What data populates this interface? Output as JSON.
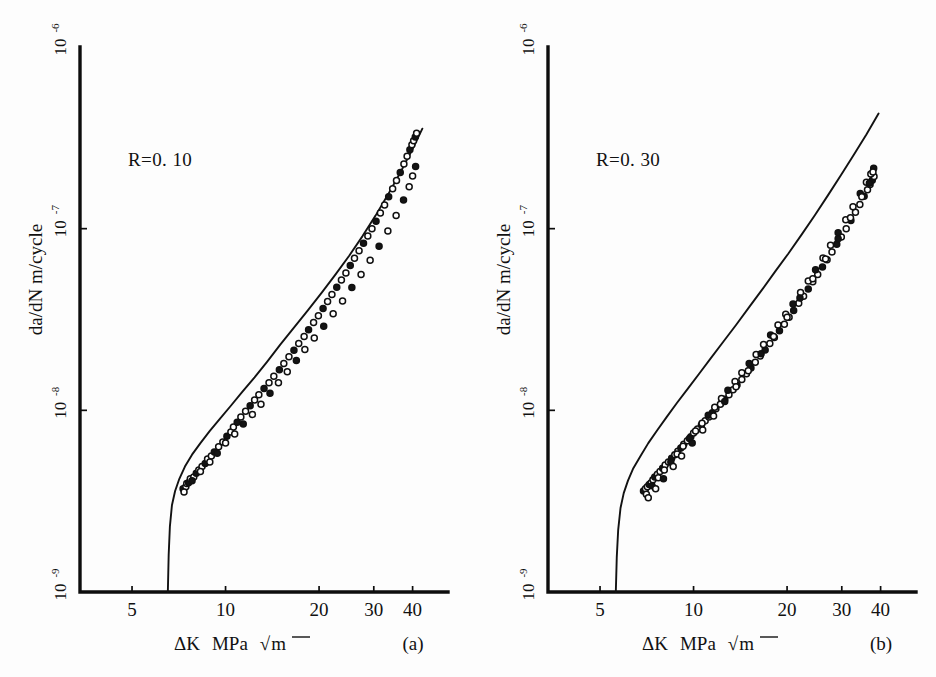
{
  "figure": {
    "panel_count": 2,
    "background": "#fdfdfd",
    "ink_color": "#111111"
  },
  "chart_data": [
    {
      "type": "scatter",
      "panel": "(a)",
      "title": "",
      "annotation": "R=0. 10",
      "annotation_parts": {
        "symbol": "R",
        "equals": "=",
        "value": "0. 10"
      },
      "xlabel": "ΔK  MPa  √m",
      "xlabel_parts": {
        "symbol": "ΔK",
        "unit": "MPa",
        "radical": "√",
        "radicand": "m"
      },
      "ylabel": "da/dN  m/cycle",
      "ylabel_parts": {
        "rate": "da/dN",
        "unit": "m/cycle"
      },
      "xscale": "log",
      "yscale": "log",
      "xlim": [
        3.4,
        52.0
      ],
      "ylim": [
        1e-09,
        1e-06
      ],
      "xticks": [
        5,
        10,
        20,
        30,
        40
      ],
      "xtick_labels": [
        "5",
        "10",
        "20",
        "30",
        "40"
      ],
      "yticks": [
        1e-09,
        1e-08,
        1e-07,
        1e-06
      ],
      "ytick_labels": [
        "10⁻⁹",
        "10⁻⁸",
        "10⁻⁷",
        "10⁻⁶"
      ],
      "ytick_mantissa": [
        "10",
        "10",
        "10",
        "10"
      ],
      "ytick_exponent": [
        "-9",
        "-8",
        "-7",
        "-6"
      ],
      "grid": false,
      "legend": "none",
      "threshold_dk": 6.5,
      "series": [
        {
          "name": "fit-curve",
          "kind": "line",
          "comment": "sigmoidal Paris-law fit with threshold asymptote",
          "x": [
            6.52,
            6.56,
            6.62,
            6.72,
            6.88,
            7.1,
            7.4,
            7.8,
            8.3,
            8.9,
            9.6,
            10.4,
            11.3,
            12.4,
            13.6,
            15.0,
            16.6,
            18.4,
            20.4,
            22.6,
            25.0,
            27.6,
            30.4,
            33.4,
            36.6,
            40.0,
            43.0
          ],
          "y": [
            1e-09,
            1.6e-09,
            2.3e-09,
            3e-09,
            3.6e-09,
            4.2e-09,
            4.9e-09,
            5.7e-09,
            6.6e-09,
            7.7e-09,
            9e-09,
            1.06e-08,
            1.26e-08,
            1.52e-08,
            1.85e-08,
            2.3e-08,
            2.85e-08,
            3.55e-08,
            4.45e-08,
            5.6e-08,
            7.1e-08,
            9.1e-08,
            1.18e-07,
            1.55e-07,
            2.05e-07,
            2.75e-07,
            3.55e-07
          ]
        },
        {
          "name": "measured-growth-rate",
          "kind": "points",
          "marker": "circle",
          "x": [
            7.3,
            7.45,
            7.5,
            7.6,
            7.7,
            7.9,
            8.05,
            8.2,
            8.4,
            8.6,
            8.75,
            9.0,
            9.2,
            9.5,
            9.8,
            10.1,
            10.4,
            10.6,
            10.9,
            11.2,
            11.6,
            12.0,
            12.4,
            12.8,
            13.3,
            13.8,
            14.3,
            14.9,
            15.4,
            16.0,
            16.6,
            17.2,
            17.9,
            18.5,
            19.2,
            19.9,
            20.6,
            21.3,
            22.0,
            22.8,
            23.6,
            24.4,
            25.2,
            26.0,
            26.9,
            27.8,
            28.7,
            29.6,
            30.5,
            31.5,
            32.5,
            33.5,
            34.5,
            35.5,
            36.5,
            37.5,
            38.4,
            39.2,
            39.8,
            40.3,
            40.8,
            41.2,
            7.35,
            7.8,
            8.3,
            8.9,
            9.4,
            10.0,
            10.7,
            11.4,
            12.2,
            13.0,
            13.9,
            14.8,
            15.8,
            16.9,
            18.0,
            19.3,
            20.7,
            22.2,
            23.8,
            25.5,
            27.3,
            29.2,
            31.2,
            33.3,
            35.4,
            37.4,
            39.0,
            40.0,
            40.9
          ],
          "y": [
            3.7e-09,
            3.8e-09,
            3.95e-09,
            4e-09,
            4.2e-09,
            4.3e-09,
            4.5e-09,
            4.7e-09,
            4.9e-09,
            5.1e-09,
            5.4e-09,
            5.6e-09,
            5.9e-09,
            6.3e-09,
            6.7e-09,
            7.2e-09,
            7.6e-09,
            8.1e-09,
            8.6e-09,
            9.2e-09,
            9.9e-09,
            1.06e-08,
            1.14e-08,
            1.22e-08,
            1.32e-08,
            1.42e-08,
            1.54e-08,
            1.67e-08,
            1.81e-08,
            1.97e-08,
            2.14e-08,
            2.33e-08,
            2.55e-08,
            2.78e-08,
            3.04e-08,
            3.32e-08,
            3.63e-08,
            3.97e-08,
            4.34e-08,
            4.76e-08,
            5.21e-08,
            5.71e-08,
            6.26e-08,
            6.87e-08,
            7.55e-08,
            8.3e-08,
            9.12e-08,
            1e-07,
            1.1e-07,
            1.22e-07,
            1.35e-07,
            1.5e-07,
            1.66e-07,
            1.84e-07,
            2.04e-07,
            2.27e-07,
            2.5e-07,
            2.72e-07,
            2.9e-07,
            3.05e-07,
            3.2e-07,
            3.35e-07,
            3.55e-09,
            4.1e-09,
            4.6e-09,
            5.2e-09,
            5.8e-09,
            6.6e-09,
            7.4e-09,
            8.4e-09,
            9.5e-09,
            1.08e-08,
            1.24e-08,
            1.42e-08,
            1.63e-08,
            1.88e-08,
            2.16e-08,
            2.5e-08,
            2.9e-08,
            3.4e-08,
            4e-08,
            4.75e-08,
            5.6e-08,
            6.7e-08,
            8e-08,
            9.7e-08,
            1.18e-07,
            1.44e-07,
            1.7e-07,
            1.95e-07,
            2.2e-07
          ]
        }
      ]
    },
    {
      "type": "scatter",
      "panel": "(b)",
      "title": "",
      "annotation": "R=0. 30",
      "annotation_parts": {
        "symbol": "R",
        "equals": "=",
        "value": "0. 30"
      },
      "xlabel": "ΔK  MPa  √m",
      "xlabel_parts": {
        "symbol": "ΔK",
        "unit": "MPa",
        "radical": "√",
        "radicand": "m"
      },
      "ylabel": "da/dN  m/cycle",
      "ylabel_parts": {
        "rate": "da/dN",
        "unit": "m/cycle"
      },
      "xscale": "log",
      "yscale": "log",
      "xlim": [
        3.4,
        52.0
      ],
      "ylim": [
        1e-09,
        1e-06
      ],
      "xticks": [
        5,
        10,
        20,
        30,
        40
      ],
      "xtick_labels": [
        "5",
        "10",
        "20",
        "30",
        "40"
      ],
      "yticks": [
        1e-09,
        1e-08,
        1e-07,
        1e-06
      ],
      "ytick_labels": [
        "10⁻⁹",
        "10⁻⁸",
        "10⁻⁷",
        "10⁻⁶"
      ],
      "ytick_mantissa": [
        "10",
        "10",
        "10",
        "10"
      ],
      "ytick_exponent": [
        "-9",
        "-8",
        "-7",
        "-6"
      ],
      "grid": false,
      "legend": "none",
      "threshold_dk": 5.6,
      "series": [
        {
          "name": "fit-curve",
          "kind": "line",
          "comment": "sigmoidal Paris-law fit with threshold asymptote",
          "x": [
            5.62,
            5.66,
            5.72,
            5.82,
            5.96,
            6.15,
            6.4,
            6.75,
            7.15,
            7.65,
            8.2,
            8.85,
            9.6,
            10.45,
            11.4,
            12.5,
            13.7,
            15.1,
            16.6,
            18.3,
            20.2,
            22.3,
            24.6,
            27.1,
            29.8,
            32.8,
            36.0,
            39.4
          ],
          "y": [
            1e-09,
            1.55e-09,
            2.2e-09,
            2.9e-09,
            3.5e-09,
            4.1e-09,
            4.8e-09,
            5.6e-09,
            6.6e-09,
            7.8e-09,
            9.2e-09,
            1.1e-08,
            1.32e-08,
            1.6e-08,
            1.95e-08,
            2.4e-08,
            2.95e-08,
            3.7e-08,
            4.6e-08,
            5.8e-08,
            7.3e-08,
            9.3e-08,
            1.19e-07,
            1.53e-07,
            1.97e-07,
            2.55e-07,
            3.3e-07,
            4.3e-07
          ]
        },
        {
          "name": "measured-growth-rate",
          "kind": "points",
          "marker": "circle",
          "x": [
            6.9,
            7.0,
            7.1,
            7.2,
            7.3,
            7.4,
            7.5,
            7.65,
            7.8,
            7.95,
            8.1,
            8.3,
            8.5,
            8.7,
            8.9,
            9.1,
            9.3,
            9.55,
            9.8,
            10.0,
            10.3,
            10.6,
            10.9,
            11.2,
            11.5,
            11.8,
            12.2,
            12.6,
            13.0,
            13.4,
            13.8,
            14.3,
            14.8,
            15.3,
            15.8,
            16.4,
            17.0,
            17.6,
            18.2,
            18.9,
            19.6,
            20.3,
            21.0,
            21.8,
            22.6,
            23.4,
            24.2,
            25.1,
            26.0,
            26.9,
            27.9,
            28.9,
            29.9,
            31.0,
            32.1,
            33.2,
            34.3,
            35.4,
            36.3,
            37.0,
            37.6,
            38.1,
            7.05,
            7.35,
            7.7,
            8.05,
            8.45,
            8.85,
            9.25,
            9.7,
            10.15,
            10.65,
            11.15,
            11.7,
            12.3,
            12.9,
            13.6,
            14.3,
            15.1,
            15.9,
            16.8,
            17.7,
            18.7,
            19.8,
            20.9,
            22.1,
            23.4,
            24.7,
            26.1,
            27.6,
            29.2,
            30.9,
            32.6,
            34.4,
            36.0,
            37.2,
            38.0,
            7.15,
            7.55,
            8.0,
            8.6,
            9.15,
            9.9,
            10.7,
            11.6,
            12.6,
            13.7,
            15.0,
            16.5,
            18.1,
            20.0,
            22.0,
            24.2,
            26.6,
            29.2,
            32.0,
            34.8,
            36.8,
            37.8
          ],
          "y": [
            3.6e-09,
            3.7e-09,
            3.8e-09,
            3.9e-09,
            4e-09,
            4.15e-09,
            4.3e-09,
            4.45e-09,
            4.6e-09,
            4.8e-09,
            5e-09,
            5.2e-09,
            5.45e-09,
            5.7e-09,
            5.95e-09,
            6.2e-09,
            6.5e-09,
            6.8e-09,
            7.15e-09,
            7.5e-09,
            7.9e-09,
            8.3e-09,
            8.75e-09,
            9.2e-09,
            9.7e-09,
            1.02e-08,
            1.08e-08,
            1.15e-08,
            1.22e-08,
            1.3e-08,
            1.38e-08,
            1.48e-08,
            1.59e-08,
            1.71e-08,
            1.84e-08,
            1.99e-08,
            2.15e-08,
            2.33e-08,
            2.52e-08,
            2.74e-08,
            2.98e-08,
            3.25e-08,
            3.54e-08,
            3.88e-08,
            4.25e-08,
            4.65e-08,
            5.1e-08,
            5.6e-08,
            6.15e-08,
            6.75e-08,
            7.45e-08,
            8.2e-08,
            9e-08,
            1e-07,
            1.11e-07,
            1.23e-07,
            1.36e-07,
            1.51e-07,
            1.64e-07,
            1.75e-07,
            1.85e-07,
            1.94e-07,
            3.45e-09,
            3.85e-09,
            4.25e-09,
            4.7e-09,
            5.2e-09,
            5.75e-09,
            6.35e-09,
            7e-09,
            7.7e-09,
            8.5e-09,
            9.4e-09,
            1.04e-08,
            1.16e-08,
            1.29e-08,
            1.44e-08,
            1.61e-08,
            1.81e-08,
            2.03e-08,
            2.3e-08,
            2.6e-08,
            2.95e-08,
            3.38e-08,
            3.85e-08,
            4.45e-08,
            5.15e-08,
            5.95e-08,
            6.9e-08,
            8.1e-08,
            9.5e-08,
            1.12e-07,
            1.32e-07,
            1.56e-07,
            1.8e-07,
            2e-07,
            2.15e-07,
            3.3e-09,
            3.7e-09,
            4.2e-09,
            4.9e-09,
            5.6e-09,
            6.6e-09,
            7.8e-09,
            9.3e-09,
            1.12e-08,
            1.35e-08,
            1.65e-08,
            2.05e-08,
            2.55e-08,
            3.25e-08,
            4.15e-08,
            5.3e-08,
            6.8e-08,
            8.8e-08,
            1.15e-07,
            1.5e-07,
            1.78e-07,
            2.05e-07
          ]
        }
      ]
    }
  ]
}
